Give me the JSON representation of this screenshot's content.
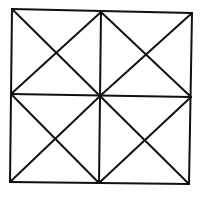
{
  "diagram": {
    "stroke_color": "#111111",
    "background": "#ffffff",
    "points": {
      "tl": [
        12,
        9
      ],
      "tm": [
        101,
        12
      ],
      "tr": [
        192,
        13
      ],
      "ml": [
        11,
        94
      ],
      "c": [
        100,
        96
      ],
      "mr": [
        191,
        97
      ],
      "bl": [
        10,
        182
      ],
      "bm": [
        99,
        183
      ],
      "br": [
        189,
        184
      ]
    },
    "segments": [
      {
        "name": "outer-top",
        "from": "tl",
        "to": "tr"
      },
      {
        "name": "outer-right",
        "from": "tr",
        "to": "br"
      },
      {
        "name": "outer-bottom",
        "from": "bl",
        "to": "br"
      },
      {
        "name": "outer-left",
        "from": "tl",
        "to": "bl"
      },
      {
        "name": "mid-vertical",
        "from": "tm",
        "to": "bm"
      },
      {
        "name": "mid-horizontal",
        "from": "ml",
        "to": "mr"
      },
      {
        "name": "tl-diag-a",
        "from": "tl",
        "to": "c"
      },
      {
        "name": "tl-diag-b",
        "from": "tm",
        "to": "ml"
      },
      {
        "name": "tr-diag-a",
        "from": "tm",
        "to": "mr"
      },
      {
        "name": "tr-diag-b",
        "from": "tr",
        "to": "c"
      },
      {
        "name": "bl-diag-a",
        "from": "ml",
        "to": "bm"
      },
      {
        "name": "bl-diag-b",
        "from": "c",
        "to": "bl"
      },
      {
        "name": "br-diag-a",
        "from": "c",
        "to": "br"
      },
      {
        "name": "br-diag-b",
        "from": "mr",
        "to": "bm"
      }
    ]
  }
}
